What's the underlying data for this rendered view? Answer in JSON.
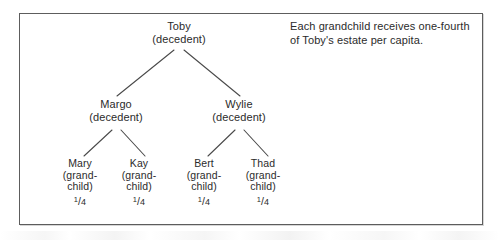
{
  "figure": {
    "border_color": "#5d5d5d",
    "background": "#ffffff",
    "text_color": "#2b2b2b"
  },
  "annotation": {
    "text": "Each grandchild receives one-fourth of Toby's estate per capita."
  },
  "tree": {
    "root": {
      "name": "Toby",
      "role": "(decedent)"
    },
    "children": [
      {
        "name": "Margo",
        "role": "(decedent)"
      },
      {
        "name": "Wylie",
        "role": "(decedent)"
      }
    ],
    "grandchildren": [
      {
        "name": "Mary",
        "role_line1": "(grand-",
        "role_line2": "child)",
        "share_numerator": "1",
        "share_slash": "/",
        "share_denominator": "4"
      },
      {
        "name": "Kay",
        "role_line1": "(grand-",
        "role_line2": "child)",
        "share_numerator": "1",
        "share_slash": "/",
        "share_denominator": "4"
      },
      {
        "name": "Bert",
        "role_line1": "(grand-",
        "role_line2": "child)",
        "share_numerator": "1",
        "share_slash": "/",
        "share_denominator": "4"
      },
      {
        "name": "Thad",
        "role_line1": "(grand-",
        "role_line2": "child)",
        "share_numerator": "1",
        "share_slash": "/",
        "share_denominator": "4"
      }
    ]
  }
}
